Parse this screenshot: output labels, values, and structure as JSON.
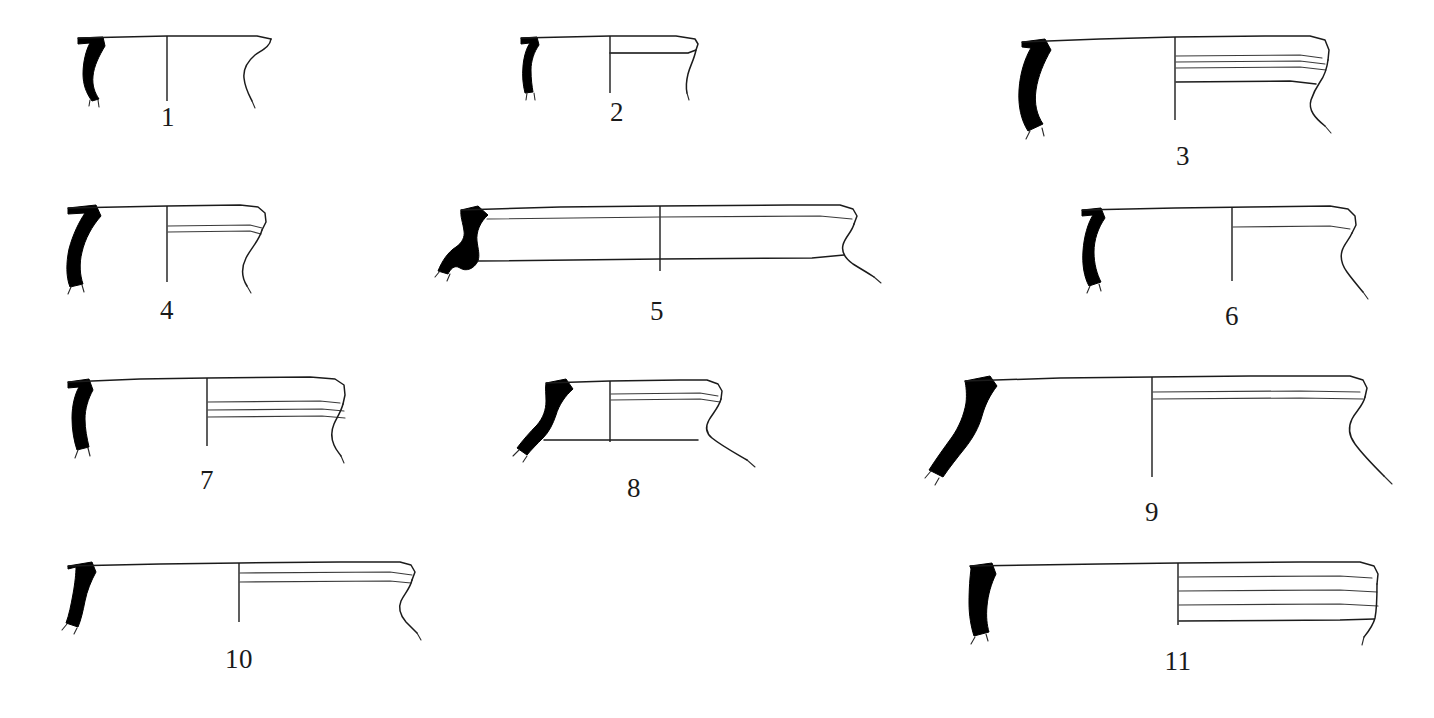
{
  "plate": {
    "title": "Ceramic vessel rim profile plate",
    "description": "Archaeological line drawing plate of eleven pottery rim profiles, each drawn in half-section with the sectioned wall shown solid black at the left, the rim diameter axis line at centre, and the exterior profile to the right. Each drawing is numbered beneath.",
    "background_color": "#ffffff",
    "ink_color": "#1b1b1b",
    "section_fill_color": "#000000",
    "figure_count": 11
  },
  "figures": [
    {
      "number": "1",
      "label": "1",
      "label_x": 168,
      "label_y": 104,
      "row": 1,
      "description": "Small everted rim, simple thin wall, wavy carinated exterior profile"
    },
    {
      "number": "2",
      "label": "2",
      "label_x": 617,
      "label_y": 99,
      "row": 1,
      "description": "Short everted rim, flat lip with narrow interior bevel line"
    },
    {
      "number": "3",
      "label": "3",
      "label_x": 1183,
      "label_y": 143,
      "row": 1,
      "description": "Large thickened rim with three horizontal grooves below the lip"
    },
    {
      "number": "4",
      "label": "4",
      "label_x": 167,
      "label_y": 297,
      "row": 2,
      "description": "S-curved wall, rounded rolled rim, single groove"
    },
    {
      "number": "5",
      "label": "5",
      "label_x": 657,
      "label_y": 298,
      "row": 2,
      "description": "Wide shallow basin rim, double horizontal lines, hooked exterior edge"
    },
    {
      "number": "6",
      "label": "6",
      "label_x": 1232,
      "label_y": 303,
      "row": 2,
      "description": "Everted rim with flattened lip and single interior line"
    },
    {
      "number": "7",
      "label": "7",
      "label_x": 207,
      "label_y": 467,
      "row": 3,
      "description": "Thickened rim with two parallel grooves, undercut exterior"
    },
    {
      "number": "8",
      "label": "8",
      "label_x": 634,
      "label_y": 475,
      "row": 3,
      "description": "Short squat rim with bevelled lip and horizontal groove"
    },
    {
      "number": "9",
      "label": "9",
      "label_x": 1152,
      "label_y": 499,
      "row": 3,
      "description": "Large storage vessel rim, heavy black sectioned wall, flaring body"
    },
    {
      "number": "10",
      "label": "10",
      "label_x": 239,
      "label_y": 646,
      "row": 4,
      "description": "Long flat rim with double line and angled exterior edge"
    },
    {
      "number": "11",
      "label": "11",
      "label_x": 1178,
      "label_y": 648,
      "row": 4,
      "description": "Broad rim with four horizontal grooves forming a ribbed band"
    }
  ]
}
